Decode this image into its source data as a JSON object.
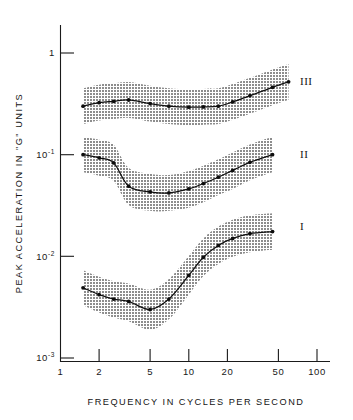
{
  "chart_data": {
    "type": "line",
    "title": "",
    "xlabel": "FREQUENCY IN CYCLES PER SECOND",
    "ylabel": "PEAK ACCELERATION IN \"G\" UNITS",
    "xscale": "log",
    "yscale": "log",
    "xlim": [
      1,
      100
    ],
    "ylim": [
      0.001,
      1
    ],
    "grid": false,
    "legend_position": "right-of-curves",
    "x_ticks": [
      1,
      2,
      5,
      10,
      20,
      50,
      100
    ],
    "x_tick_labels": [
      "1",
      "2",
      "5",
      "10",
      "20",
      "50",
      "100"
    ],
    "y_ticks": [
      1,
      0.1,
      0.01,
      0.001
    ],
    "y_tick_labels": [
      "1",
      "10-1",
      "10-2",
      "10-3"
    ],
    "y_tick_mantissa": [
      "1",
      "10",
      "10",
      "10"
    ],
    "y_tick_exponent": [
      "",
      "-1",
      "-2",
      "-3"
    ],
    "band_color": "#a8a8a8",
    "line_color": "#101010",
    "series": [
      {
        "name": "I",
        "label": "I",
        "x": [
          1.5,
          2.0,
          2.6,
          3.4,
          5.0,
          7.0,
          10.0,
          13.0,
          17.0,
          22.0,
          30.0,
          45.0
        ],
        "values": [
          0.0049,
          0.0042,
          0.0038,
          0.0036,
          0.003,
          0.0038,
          0.0065,
          0.0098,
          0.0128,
          0.015,
          0.0167,
          0.0175
        ],
        "band_lower": [
          0.0033,
          0.0028,
          0.0025,
          0.0023,
          0.0019,
          0.0024,
          0.0042,
          0.0064,
          0.0084,
          0.0099,
          0.011,
          0.0116
        ],
        "band_upper": [
          0.0073,
          0.0063,
          0.0057,
          0.0054,
          0.0047,
          0.006,
          0.0101,
          0.015,
          0.0196,
          0.0229,
          0.0253,
          0.0265
        ]
      },
      {
        "name": "II",
        "label": "II",
        "x": [
          1.5,
          2.0,
          2.6,
          3.4,
          5.0,
          7.0,
          10.0,
          13.0,
          17.0,
          22.0,
          30.0,
          45.0
        ],
        "values": [
          0.1,
          0.093,
          0.083,
          0.049,
          0.043,
          0.042,
          0.046,
          0.052,
          0.06,
          0.07,
          0.084,
          0.1
        ],
        "band_lower": [
          0.067,
          0.062,
          0.055,
          0.032,
          0.028,
          0.028,
          0.03,
          0.034,
          0.04,
          0.046,
          0.056,
          0.067
        ],
        "band_upper": [
          0.15,
          0.14,
          0.125,
          0.074,
          0.065,
          0.063,
          0.069,
          0.078,
          0.09,
          0.105,
          0.126,
          0.15
        ]
      },
      {
        "name": "III",
        "label": "III",
        "x": [
          1.5,
          2.0,
          2.6,
          3.4,
          5.0,
          7.0,
          10.0,
          13.0,
          17.0,
          22.0,
          30.0,
          45.0,
          60.0
        ],
        "values": [
          0.3,
          0.325,
          0.335,
          0.345,
          0.318,
          0.3,
          0.293,
          0.295,
          0.3,
          0.33,
          0.38,
          0.46,
          0.52
        ],
        "band_lower": [
          0.2,
          0.217,
          0.224,
          0.23,
          0.212,
          0.2,
          0.195,
          0.197,
          0.2,
          0.22,
          0.253,
          0.307,
          0.347
        ],
        "band_upper": [
          0.45,
          0.488,
          0.503,
          0.518,
          0.477,
          0.45,
          0.44,
          0.443,
          0.45,
          0.495,
          0.57,
          0.69,
          0.78
        ]
      }
    ]
  }
}
